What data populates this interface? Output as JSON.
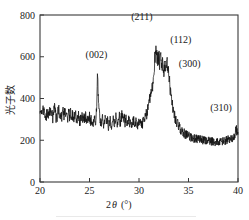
{
  "figure": {
    "kind": "xrd-diffraction-pattern",
    "background_color": "#ffffff",
    "trace_color": "#111111",
    "axis_color": "#3a3a3a"
  },
  "axes": {
    "x_title_main": "2",
    "x_title_italic": "θ",
    "x_title_unit": "(°)",
    "y_title": "光子数",
    "x_ticks": [
      "20",
      "25",
      "30",
      "35",
      "40"
    ],
    "y_ticks": [
      "0",
      "200",
      "400",
      "600",
      "800"
    ]
  },
  "peaks": [
    {
      "label": "(002)",
      "two_theta": 25.8,
      "intensity": 490
    },
    {
      "label": "(211)",
      "two_theta": 31.7,
      "intensity": 650
    },
    {
      "label": "(112)",
      "two_theta": 32.2,
      "intensity": 600
    },
    {
      "label": "(300)",
      "two_theta": 32.9,
      "intensity": 560
    },
    {
      "label": "(310)",
      "two_theta": 39.8,
      "intensity": 255
    }
  ],
  "chart_data": {
    "type": "line",
    "title": "",
    "subtitle": "",
    "xlabel": "2θ (°)",
    "ylabel": "光子数",
    "xlim": [
      20,
      40
    ],
    "ylim": [
      0,
      800
    ],
    "xticks": [
      20,
      25,
      30,
      35,
      40
    ],
    "yticks": [
      0,
      200,
      400,
      600,
      800
    ],
    "grid": false,
    "legend": null,
    "annotations": [
      {
        "text": "(002)",
        "x": 25.8,
        "y": 490
      },
      {
        "text": "(211)",
        "x": 31.7,
        "y": 650
      },
      {
        "text": "(112)",
        "x": 32.2,
        "y": 600
      },
      {
        "text": "(300)",
        "x": 32.9,
        "y": 560
      },
      {
        "text": "(310)",
        "x": 39.8,
        "y": 255
      }
    ],
    "series": [
      {
        "name": "intensity",
        "x": [
          20.0,
          20.1,
          20.2,
          20.3,
          20.4,
          20.5,
          20.6,
          20.7,
          20.8,
          20.9,
          21.0,
          21.1,
          21.2,
          21.3,
          21.4,
          21.5,
          21.6,
          21.7,
          21.8,
          21.9,
          22.0,
          22.1,
          22.2,
          22.3,
          22.4,
          22.5,
          22.6,
          22.7,
          22.8,
          22.9,
          23.0,
          23.1,
          23.2,
          23.3,
          23.4,
          23.5,
          23.6,
          23.7,
          23.8,
          23.9,
          24.0,
          24.1,
          24.2,
          24.3,
          24.4,
          24.5,
          24.6,
          24.7,
          24.8,
          24.9,
          25.0,
          25.1,
          25.2,
          25.3,
          25.4,
          25.5,
          25.6,
          25.7,
          25.8,
          25.9,
          26.0,
          26.1,
          26.2,
          26.3,
          26.4,
          26.5,
          26.6,
          26.7,
          26.8,
          26.9,
          27.0,
          27.1,
          27.2,
          27.3,
          27.4,
          27.5,
          27.6,
          27.7,
          27.8,
          27.9,
          28.0,
          28.1,
          28.2,
          28.3,
          28.4,
          28.5,
          28.6,
          28.7,
          28.8,
          28.9,
          29.0,
          29.1,
          29.2,
          29.3,
          29.4,
          29.5,
          29.6,
          29.7,
          29.8,
          29.9,
          30.0,
          30.1,
          30.2,
          30.3,
          30.4,
          30.5,
          30.6,
          30.7,
          30.8,
          30.9,
          31.0,
          31.1,
          31.2,
          31.3,
          31.4,
          31.5,
          31.6,
          31.7,
          31.8,
          31.9,
          32.0,
          32.1,
          32.2,
          32.3,
          32.4,
          32.5,
          32.6,
          32.7,
          32.8,
          32.9,
          33.0,
          33.1,
          33.2,
          33.3,
          33.4,
          33.5,
          33.6,
          33.7,
          33.8,
          33.9,
          34.0,
          34.1,
          34.2,
          34.3,
          34.4,
          34.5,
          34.6,
          34.7,
          34.8,
          34.9,
          35.0,
          35.1,
          35.2,
          35.3,
          35.4,
          35.5,
          35.6,
          35.7,
          35.8,
          35.9,
          36.0,
          36.1,
          36.2,
          36.3,
          36.4,
          36.5,
          36.6,
          36.7,
          36.8,
          36.9,
          37.0,
          37.1,
          37.2,
          37.3,
          37.4,
          37.5,
          37.6,
          37.7,
          37.8,
          37.9,
          38.0,
          38.1,
          38.2,
          38.3,
          38.4,
          38.5,
          38.6,
          38.7,
          38.8,
          38.9,
          39.0,
          39.1,
          39.2,
          39.3,
          39.4,
          39.5,
          39.6,
          39.7,
          39.8,
          39.9,
          40.0
        ],
        "y": [
          322,
          345,
          310,
          336,
          352,
          318,
          300,
          341,
          326,
          308,
          349,
          317,
          333,
          302,
          340,
          356,
          315,
          296,
          330,
          344,
          311,
          327,
          299,
          338,
          318,
          347,
          305,
          322,
          295,
          334,
          313,
          340,
          301,
          325,
          288,
          318,
          335,
          297,
          312,
          329,
          285,
          306,
          322,
          290,
          311,
          298,
          318,
          282,
          303,
          293,
          316,
          288,
          300,
          278,
          295,
          310,
          286,
          340,
          490,
          420,
          330,
          296,
          282,
          305,
          272,
          290,
          310,
          278,
          296,
          265,
          286,
          302,
          270,
          292,
          308,
          276,
          294,
          312,
          280,
          299,
          318,
          286,
          304,
          325,
          292,
          310,
          282,
          300,
          270,
          288,
          305,
          275,
          292,
          266,
          284,
          300,
          272,
          290,
          262,
          280,
          296,
          274,
          292,
          268,
          286,
          302,
          300,
          318,
          330,
          355,
          388,
          400,
          420,
          440,
          470,
          520,
          590,
          650,
          612,
          578,
          600,
          560,
          598,
          545,
          572,
          520,
          556,
          530,
          565,
          560,
          510,
          470,
          430,
          395,
          362,
          336,
          318,
          300,
          288,
          278,
          268,
          260,
          252,
          246,
          240,
          236,
          232,
          228,
          226,
          223,
          220,
          218,
          216,
          214,
          212,
          210,
          209,
          207,
          206,
          205,
          204,
          203,
          202,
          201,
          200,
          199,
          198,
          198,
          197,
          196,
          196,
          195,
          195,
          194,
          194,
          193,
          193,
          192,
          192,
          192,
          191,
          191,
          192,
          192,
          193,
          194,
          195,
          196,
          198,
          200,
          202,
          205,
          208,
          210,
          213,
          216,
          220,
          228,
          255,
          240,
          232
        ]
      }
    ]
  }
}
